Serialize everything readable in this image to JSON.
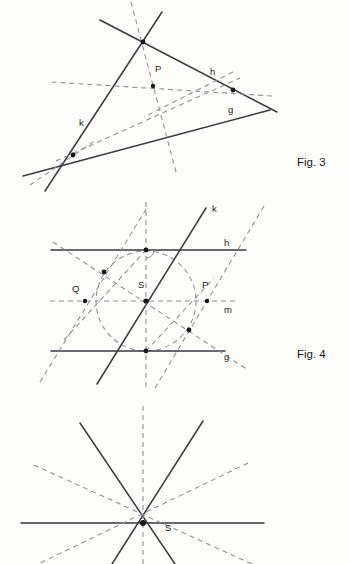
{
  "page": {
    "background": "#fdfdfc",
    "ink": "#3a3a3f",
    "construction_ink": "#8e8e93",
    "width": 349,
    "height": 564
  },
  "figures": [
    {
      "id": "fig3",
      "caption": "Fig. 3",
      "caption_pos": {
        "x": 297,
        "y": 166
      },
      "description": "Triangle formed by three solid lines g, h, k with incenter P and dashed angle bisectors",
      "labels": [
        {
          "name": "line-label-h",
          "text": "h",
          "x": 210,
          "y": 75
        },
        {
          "name": "line-label-g",
          "text": "g",
          "x": 228,
          "y": 113
        },
        {
          "name": "line-label-k",
          "text": "k",
          "x": 79,
          "y": 126
        },
        {
          "name": "point-label-P",
          "text": "P",
          "x": 155,
          "y": 72
        }
      ],
      "points": [
        {
          "name": "vertex-top",
          "x": 143,
          "y": 42
        },
        {
          "name": "incenter-P",
          "x": 153,
          "y": 86
        },
        {
          "name": "vertex-right",
          "x": 233,
          "y": 90
        },
        {
          "name": "vertex-left",
          "x": 73,
          "y": 155
        }
      ]
    },
    {
      "id": "fig4",
      "caption": "Fig. 4",
      "caption_pos": {
        "x": 297,
        "y": 358
      },
      "description": "Two parallel solid lines h and g, transversal k, dashed midline m, dashed circle centred at S",
      "labels": [
        {
          "name": "line-label-k",
          "text": "k",
          "x": 212,
          "y": 212
        },
        {
          "name": "line-label-h",
          "text": "h",
          "x": 224,
          "y": 246
        },
        {
          "name": "point-label-S",
          "text": "S",
          "x": 138,
          "y": 288
        },
        {
          "name": "point-label-Q",
          "text": "Q",
          "x": 72,
          "y": 292
        },
        {
          "name": "point-label-P",
          "text": "P",
          "x": 202,
          "y": 288
        },
        {
          "name": "line-label-m",
          "text": "m",
          "x": 224,
          "y": 313
        },
        {
          "name": "line-label-g",
          "text": "g",
          "x": 224,
          "y": 360
        }
      ],
      "points": [
        {
          "name": "point-on-h",
          "x": 146,
          "y": 250
        },
        {
          "name": "point-upper-left",
          "x": 104,
          "y": 272
        },
        {
          "name": "centre-S",
          "x": 146,
          "y": 301
        },
        {
          "name": "point-Q",
          "x": 85,
          "y": 301
        },
        {
          "name": "point-P",
          "x": 207,
          "y": 301
        },
        {
          "name": "point-lower-right",
          "x": 189,
          "y": 330
        },
        {
          "name": "point-on-g",
          "x": 146,
          "y": 351
        }
      ],
      "circle": {
        "cx": 146,
        "cy": 301,
        "r": 50
      }
    },
    {
      "id": "fig5",
      "caption": "",
      "description": "Pencil of eight concurrent lines through point S: solid horizontal, solid V-pair, dashed vertical and dashed oblique pair",
      "labels": [
        {
          "name": "point-label-S",
          "text": "S",
          "x": 165,
          "y": 530
        }
      ],
      "points": [
        {
          "name": "centre-S",
          "x": 143,
          "y": 523
        }
      ]
    }
  ]
}
